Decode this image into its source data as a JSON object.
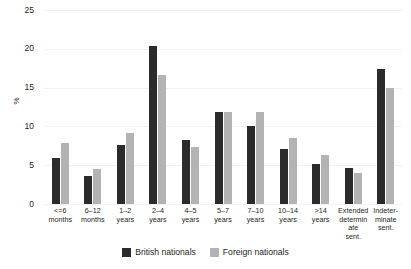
{
  "chart_data": {
    "type": "bar",
    "title": "",
    "subtitle": "",
    "xlabel": "",
    "ylabel": "%",
    "ylim": [
      0,
      25
    ],
    "yticks": [
      0,
      5,
      10,
      15,
      20,
      25
    ],
    "ytick_labels": [
      "0",
      "5",
      "10",
      "15",
      "20",
      "25"
    ],
    "grid": true,
    "legend_position": "bottom",
    "categories": [
      "<=6 months",
      "6–12 months",
      "1–2 years",
      "2–4 years",
      "4–5 years",
      "5–7 years",
      "7–10 years",
      "10–14 years",
      ">14 years",
      "Extended determinate sent.",
      "Indeterminate sent."
    ],
    "category_lines": [
      [
        "<=6",
        "months"
      ],
      [
        "6–12",
        "months"
      ],
      [
        "1–2",
        "years"
      ],
      [
        "2–4",
        "years"
      ],
      [
        "4–5",
        "years"
      ],
      [
        "5–7",
        "years"
      ],
      [
        "7–10",
        "years"
      ],
      [
        "10–14",
        "years"
      ],
      [
        ">14",
        "years"
      ],
      [
        "Extended",
        "determinate",
        "sent."
      ],
      [
        "Indeter-",
        "minate",
        "sent."
      ]
    ],
    "series": [
      {
        "name": "British nationals",
        "color": "#2b2b2b",
        "values": [
          5.9,
          3.6,
          7.6,
          20.4,
          8.2,
          11.8,
          10.0,
          7.1,
          5.2,
          4.7,
          17.4
        ]
      },
      {
        "name": "Foreign nationals",
        "color": "#b3b3b3",
        "values": [
          7.8,
          4.5,
          9.1,
          16.6,
          7.3,
          11.9,
          11.8,
          8.5,
          6.3,
          4.0,
          14.9
        ]
      }
    ]
  },
  "legend": {
    "items": [
      {
        "label": "British nationals",
        "color": "#2b2b2b"
      },
      {
        "label": "Foreign nationals",
        "color": "#b3b3b3"
      }
    ]
  }
}
